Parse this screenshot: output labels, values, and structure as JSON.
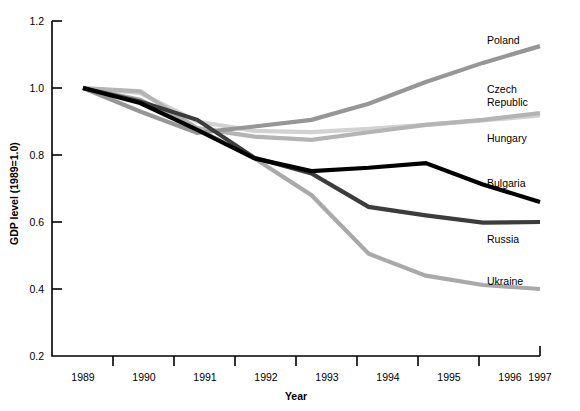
{
  "chart_data": {
    "type": "line",
    "title": "",
    "xlabel": "Year",
    "ylabel": "GDP level (1989=1.0)",
    "x": [
      1989,
      1990,
      1991,
      1992,
      1993,
      1994,
      1995,
      1996,
      1997
    ],
    "xtick_labels": [
      "1989",
      "1990",
      "1991",
      "1992",
      "1993",
      "1994",
      "1995",
      "1996",
      "1997"
    ],
    "ytick_labels": [
      "0.2",
      "0.4",
      "0.6",
      "0.8",
      "1.0",
      "1.2"
    ],
    "ytick_values": [
      0.2,
      0.4,
      0.6,
      0.8,
      1.0,
      1.2
    ],
    "xlim": [
      1989,
      1997
    ],
    "ylim": [
      0.2,
      1.2
    ],
    "grid": false,
    "legend_position": "right-inline-labels",
    "series": [
      {
        "name": "Poland",
        "color": "#969696",
        "values": [
          1.0,
          0.93,
          0.866,
          0.885,
          0.905,
          0.953,
          1.018,
          1.075,
          1.125
        ],
        "label": "Poland"
      },
      {
        "name": "Czech Republic",
        "color": "#b4b4b4",
        "values": [
          1.0,
          0.99,
          0.88,
          0.855,
          0.845,
          0.868,
          0.89,
          0.905,
          0.925
        ],
        "label": "Czech\nRepublic",
        "label_lines": [
          "Czech",
          "Republic"
        ]
      },
      {
        "name": "Hungary",
        "color": "#d2d2d2",
        "values": [
          1.0,
          0.985,
          0.9,
          0.872,
          0.868,
          0.878,
          0.89,
          0.903,
          0.918
        ],
        "label": "Hungary"
      },
      {
        "name": "Bulgaria",
        "color": "#000000",
        "values": [
          1.0,
          0.955,
          0.875,
          0.79,
          0.752,
          0.762,
          0.776,
          0.712,
          0.66
        ],
        "label": "Bulgaria"
      },
      {
        "name": "Russia",
        "color": "#3c3c3c",
        "values": [
          1.0,
          0.96,
          0.905,
          0.792,
          0.745,
          0.645,
          0.62,
          0.598,
          0.6
        ],
        "label": "Russia"
      },
      {
        "name": "Ukraine",
        "color": "#a9a9a9",
        "values": [
          1.0,
          0.965,
          0.878,
          0.79,
          0.68,
          0.505,
          0.44,
          0.412,
          0.4
        ],
        "label": "Ukraine"
      }
    ]
  },
  "labels": {
    "poland": "Poland",
    "czech_line1": "Czech",
    "czech_line2": "Republic",
    "hungary": "Hungary",
    "bulgaria": "Bulgaria",
    "russia": "Russia",
    "ukraine": "Ukraine",
    "xaxis_title": "Year",
    "yaxis_title": "GDP level (1989=1.0)"
  },
  "xticks": {
    "t0": "1989",
    "t1": "1990",
    "t2": "1991",
    "t3": "1992",
    "t4": "1993",
    "t5": "1994",
    "t6": "1995",
    "t7": "1996",
    "t8": "1997"
  },
  "yticks": {
    "t0": "0.2",
    "t1": "0.4",
    "t2": "0.6",
    "t3": "0.8",
    "t4": "1.0",
    "t5": "1.2"
  }
}
